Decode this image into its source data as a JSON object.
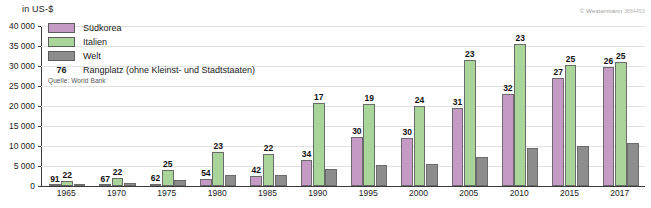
{
  "axis_unit_label": "in US-$",
  "copyright": {
    "text": "© Westermann",
    "number": "3884453"
  },
  "legend": {
    "items": [
      {
        "label": "Südkorea",
        "color": "#c59ac5",
        "key": "suedkorea"
      },
      {
        "label": "Italien",
        "color": "#a9d59b",
        "key": "italien"
      },
      {
        "label": "Welt",
        "color": "#8d8d8d",
        "key": "welt"
      }
    ],
    "rank_example": "76",
    "rank_description": "Rangplatz (ohne Kleinst- und Stadtstaaten)",
    "source": "Quelle: World Bank"
  },
  "chart_data": {
    "type": "bar",
    "title": "",
    "subtitle": "",
    "xlabel": "",
    "ylabel": "in US-$",
    "ylim": [
      0,
      40000
    ],
    "grid": true,
    "legend_position": "top-left",
    "categories": [
      "1965",
      "1970",
      "1975",
      "1980",
      "1985",
      "1990",
      "1995",
      "2000",
      "2005",
      "2010",
      "2015",
      "2017"
    ],
    "ytick_labels": [
      "0",
      "5 000",
      "10 000",
      "15 000",
      "20 000",
      "25 000",
      "30 000",
      "35 000",
      "40 000"
    ],
    "ytick_values": [
      0,
      5000,
      10000,
      15000,
      20000,
      25000,
      30000,
      35000,
      40000
    ],
    "series": [
      {
        "name": "Südkorea",
        "color": "#c59ac5",
        "values": [
          110,
          280,
          620,
          1700,
          2480,
          6600,
          12300,
          11900,
          19400,
          23000,
          27100,
          29700
        ],
        "rank_labels": [
          "91",
          "67",
          "62",
          "54",
          "42",
          "34",
          "30",
          "30",
          "31",
          "32",
          "27",
          "26"
        ]
      },
      {
        "name": "Italien",
        "color": "#a9d59b",
        "values": [
          1250,
          2100,
          4000,
          8450,
          7990,
          20800,
          20600,
          20100,
          31600,
          35500,
          30200,
          31000
        ],
        "rank_labels": [
          "22",
          "22",
          "25",
          "23",
          "22",
          "17",
          "19",
          "24",
          "23",
          "23",
          "25",
          "25"
        ]
      },
      {
        "name": "Welt",
        "color": "#8d8d8d",
        "values": [
          600,
          810,
          1560,
          2680,
          2780,
          4300,
          5300,
          5400,
          7200,
          9400,
          10000,
          10800
        ],
        "rank_labels": [
          "",
          "",
          "",
          "",
          "",
          "",
          "",
          "",
          "",
          "",
          "",
          ""
        ]
      }
    ]
  }
}
